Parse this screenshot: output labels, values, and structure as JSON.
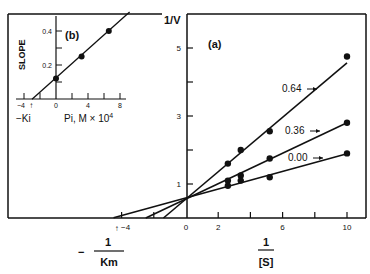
{
  "chart_data": [
    {
      "id": "a",
      "type": "line",
      "panel_label": "(a)",
      "title": "",
      "xlabel_num": "1",
      "xlabel_den": "[S]",
      "ylabel": "1/V",
      "neg_x_label_sign": "−",
      "neg_x_label_num": "1",
      "neg_x_label_den": "Km",
      "xlim": [
        -11.4,
        11.2
      ],
      "ylim": [
        0,
        5.9
      ],
      "x_ticks": [
        -4,
        -2,
        0,
        2,
        4,
        6,
        8,
        10
      ],
      "x_tick_labels": [
        {
          "value": -4,
          "text": "−4"
        },
        {
          "value": 0,
          "text": "0"
        },
        {
          "value": 2,
          "text": "2"
        },
        {
          "value": 6,
          "text": "6"
        },
        {
          "value": 10,
          "text": "10"
        }
      ],
      "y_ticks": [
        1,
        2,
        3,
        4,
        5
      ],
      "y_tick_labels": [
        {
          "value": 1,
          "text": "1"
        },
        {
          "value": 3,
          "text": "3"
        },
        {
          "value": 5,
          "text": "5"
        }
      ],
      "grid": false,
      "series": [
        {
          "name": "0.64",
          "points": [
            [
              2.6,
              1.6
            ],
            [
              3.4,
              2.0
            ],
            [
              5.2,
              2.55
            ],
            [
              10,
              4.75
            ]
          ],
          "fit": {
            "slope": 0.4,
            "intercept": 0.56
          },
          "fit_x_range": [
            -1.4,
            10
          ]
        },
        {
          "name": "0.36",
          "points": [
            [
              2.6,
              1.1
            ],
            [
              3.4,
              1.25
            ],
            [
              5.2,
              1.75
            ],
            [
              10,
              2.8
            ]
          ],
          "fit": {
            "slope": 0.224,
            "intercept": 0.56
          },
          "fit_x_range": [
            -2.5,
            10
          ]
        },
        {
          "name": "0.00",
          "points": [
            [
              2.6,
              0.95
            ],
            [
              3.4,
              1.1
            ],
            [
              5.2,
              1.2
            ],
            [
              10,
              1.9
            ]
          ],
          "fit": {
            "slope": 0.13,
            "intercept": 0.59
          },
          "fit_x_range": [
            -4.5,
            10
          ]
        }
      ],
      "annotations": [
        {
          "text": "↑",
          "x": -4.3,
          "meaning": "-1/Km arrow"
        }
      ]
    },
    {
      "id": "b",
      "type": "scatter",
      "panel_label": "(b)",
      "title": "",
      "xlabel": "Pi, M × 10",
      "xlabel_exp": "4",
      "ylabel": "SLOPE",
      "neg_x_label": "−Ki",
      "xlim": [
        -6,
        9
      ],
      "ylim": [
        0,
        0.5
      ],
      "x_ticks": [
        -4,
        -2,
        0,
        2,
        4,
        6,
        8
      ],
      "x_tick_labels": [
        {
          "value": -4,
          "text": "−4"
        },
        {
          "value": 0,
          "text": "0"
        },
        {
          "value": 4,
          "text": "4"
        },
        {
          "value": 8,
          "text": "8"
        }
      ],
      "y_ticks": [
        0.1,
        0.2,
        0.3,
        0.4
      ],
      "y_tick_labels": [
        {
          "value": 0.2,
          "text": "0.2"
        },
        {
          "value": 0.4,
          "text": "0.4"
        }
      ],
      "grid": false,
      "points": [
        [
          0,
          0.12
        ],
        [
          3.2,
          0.25
        ],
        [
          6.6,
          0.4
        ]
      ],
      "fit": {
        "slope": 0.042,
        "intercept": 0.125
      },
      "fit_x_range": [
        -3.0,
        9.2
      ],
      "annotations": [
        {
          "text": "↑",
          "x": -3.1,
          "meaning": "-Ki arrow"
        }
      ]
    }
  ]
}
